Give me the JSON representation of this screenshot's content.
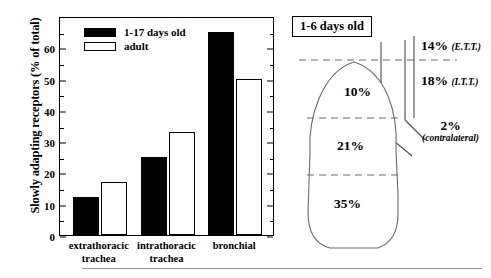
{
  "chart_data": [
    {
      "type": "bar",
      "title": "",
      "xlabel": "",
      "ylabel": "Slowly adapting receptors (% of total)",
      "ylim": [
        0,
        70
      ],
      "yticks": [
        0,
        10,
        20,
        30,
        40,
        50,
        60
      ],
      "grid": false,
      "legend_position": "top-left",
      "categories": [
        "extrathoracic trachea",
        "intrathoracic trachea",
        "bronchial"
      ],
      "category_lines": [
        [
          "extrathoracic",
          "trachea"
        ],
        [
          "intrathoracic",
          "trachea"
        ],
        [
          "bronchial",
          ""
        ]
      ],
      "series": [
        {
          "name": "1-17 days old",
          "values": [
            12,
            25,
            65
          ],
          "color": "#000000",
          "fill": "solid"
        },
        {
          "name": "adult",
          "values": [
            17,
            33,
            50
          ],
          "color": "#ffffff",
          "fill": "hollow"
        }
      ]
    },
    {
      "type": "diagram",
      "title": "1-6 days old",
      "annotations": [
        {
          "name": "upper-lung-zone",
          "value": "10%"
        },
        {
          "name": "middle-lung-zone",
          "value": "21%"
        },
        {
          "name": "lower-lung-zone",
          "value": "35%"
        },
        {
          "name": "extrathoracic-trachea",
          "value": "14%",
          "paren": "(E.T.T.)"
        },
        {
          "name": "intrathoracic-trachea",
          "value": "18%",
          "paren": "(I.T.T.)"
        },
        {
          "name": "contralateral-lung",
          "value": "2%",
          "paren": "(contralateral)"
        }
      ]
    }
  ],
  "bar_chart": {
    "y_axis_title": "Slowly adapting receptors (% of total)",
    "y_ticks": [
      "0",
      "10",
      "20",
      "30",
      "40",
      "50",
      "60"
    ],
    "legend": [
      {
        "label": "1-17 days old",
        "style": "filled"
      },
      {
        "label": "adult",
        "style": "hollow"
      }
    ],
    "groups": [
      {
        "line1": "extrathoracic",
        "line2": "trachea",
        "filled": 12,
        "hollow": 17
      },
      {
        "line1": "intrathoracic",
        "line2": "trachea",
        "filled": 25,
        "hollow": 33
      },
      {
        "line1": "bronchial",
        "line2": "",
        "filled": 65,
        "hollow": 50
      }
    ]
  },
  "lung_diagram": {
    "title": "1-6 days old",
    "zones": {
      "upper": "10%",
      "middle": "21%",
      "lower": "35%"
    },
    "airway": {
      "ett_value": "14%",
      "ett_paren": "(E.T.T.)",
      "itt_value": "18%",
      "itt_paren": "(I.T.T.)",
      "contra_value": "2%",
      "contra_paren": "(contralateral)"
    }
  }
}
